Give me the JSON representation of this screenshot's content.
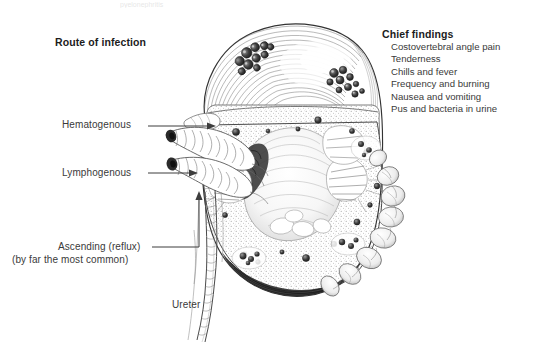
{
  "figure": {
    "title_partial_top": "pyelonephritis"
  },
  "route_panel": {
    "heading": "Route of infection",
    "labels": [
      {
        "id": "hematogenous",
        "text": "Hematogenous",
        "leader": "arrow-right"
      },
      {
        "id": "lymphogenous",
        "text": "Lymphogenous",
        "leader": "arrow-right"
      },
      {
        "id": "ascending",
        "text": "Ascending (reflux)",
        "leader": "elbow-arrow-up"
      },
      {
        "id": "ascending_note",
        "text": "(by far the most common)",
        "leader": "none"
      }
    ]
  },
  "anatomy_labels": [
    {
      "id": "ureter",
      "text": "Ureter"
    }
  ],
  "findings_panel": {
    "heading": "Chief findings",
    "items": [
      "Costovertebral angle pain",
      "Tenderness",
      "Chills and fever",
      "Frequency and burning",
      "Nausea and vomiting",
      "Pus and bacteria in urine"
    ]
  },
  "colors": {
    "background": "#ffffff",
    "ink": "#2a2a2a",
    "label_text": "#3a3a3a",
    "heading_text": "#1c1c1c",
    "line": "#444444",
    "cortex_stipple": "#8d8d8d",
    "abscess_dark": "#2b2b2b",
    "medulla_shadow": "#6f6f6f"
  },
  "illustration_parts": [
    "renal capsule with surface abscesses",
    "upper pole cut surface",
    "renal cortex stippled",
    "renal medulla pyramids with radial striations",
    "renal pelvis and calyces",
    "renal artery",
    "renal vein",
    "perinephric fat lobules",
    "ureter"
  ]
}
